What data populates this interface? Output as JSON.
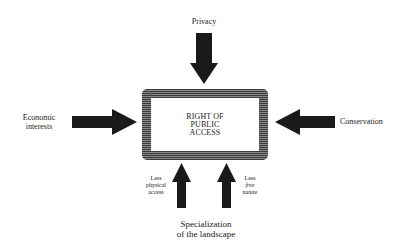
{
  "diagram": {
    "center": {
      "lines": [
        "RIGHT OF",
        "PUBLIC",
        "ACCESS"
      ]
    },
    "inputs": {
      "top": {
        "label": "Privacy",
        "direction": "down"
      },
      "left": {
        "label_lines": [
          "Economic",
          "interests"
        ],
        "direction": "right"
      },
      "right": {
        "label": "Conservation",
        "direction": "left"
      },
      "bottom": {
        "label_lines": [
          "Specialization",
          "of the landscape"
        ],
        "arrows": [
          {
            "label_lines": [
              "Less",
              "physical",
              "access"
            ],
            "direction": "up"
          },
          {
            "label_lines": [
              "Less",
              "free",
              "nature"
            ],
            "direction": "up"
          }
        ]
      }
    },
    "colors": {
      "arrow": "#1a1a1a",
      "box_border": "#5a5a5a",
      "background": "#ffffff"
    }
  }
}
